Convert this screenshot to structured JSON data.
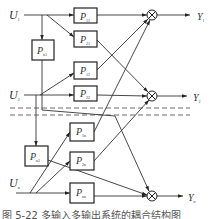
{
  "figure": {
    "type": "MIMO block diagram",
    "inputs": [
      {
        "id": "U1",
        "label": "U",
        "sub": "1"
      },
      {
        "id": "U2",
        "label": "U",
        "sub": "2"
      },
      {
        "id": "Un",
        "label": "U",
        "sub": "n"
      }
    ],
    "outputs": [
      {
        "id": "Y1",
        "label": "Y",
        "sub": "1"
      },
      {
        "id": "Y2",
        "label": "Y",
        "sub": "2"
      },
      {
        "id": "Yn",
        "label": "Y",
        "sub": "n"
      }
    ],
    "blocks": [
      {
        "id": "P11",
        "label": "P",
        "sub": "11"
      },
      {
        "id": "P21",
        "label": "P",
        "sub": "21"
      },
      {
        "id": "Pn1",
        "label": "P",
        "sub": "n1"
      },
      {
        "id": "P12",
        "label": "P",
        "sub": "12"
      },
      {
        "id": "P22",
        "label": "P",
        "sub": "22"
      },
      {
        "id": "P1n",
        "label": "P",
        "sub": "1n"
      },
      {
        "id": "P2n",
        "label": "P",
        "sub": "2n"
      },
      {
        "id": "Pn2",
        "label": "P",
        "sub": "n2"
      },
      {
        "id": "Pnn",
        "label": "P",
        "sub": "nn"
      }
    ],
    "summing_junctions": [
      "sum-1",
      "sum-2",
      "sum-n"
    ],
    "caption": "图 5-22  多输入多输出系统的耦合结构图"
  }
}
